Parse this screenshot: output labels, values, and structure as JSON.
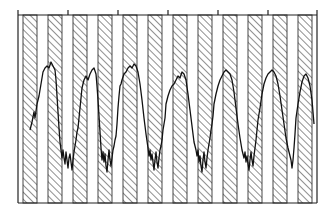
{
  "chart_data": {
    "type": "line",
    "title": "",
    "xlabel": "",
    "ylabel": "",
    "grid": false,
    "legend": null,
    "colors": {
      "line": "#111111",
      "frame": "#222222",
      "hatch": "#333333",
      "background": "#ffffff"
    },
    "frame": {
      "x0": 18,
      "y0": 15,
      "x1": 317,
      "y1": 203
    },
    "top_axis_ticks_x": [
      18,
      68,
      118,
      168,
      218,
      268,
      317
    ],
    "shaded_bands": {
      "pattern": "diagonal-hatch",
      "width": 14,
      "x_starts": [
        23,
        48,
        73,
        98,
        123,
        148,
        173,
        198,
        223,
        248,
        273,
        298
      ]
    },
    "series": [
      {
        "name": "trace",
        "cycles": 6,
        "points": [
          [
            30,
            130
          ],
          [
            32,
            122
          ],
          [
            34,
            112
          ],
          [
            35,
            118
          ],
          [
            37,
            104
          ],
          [
            39,
            96
          ],
          [
            41,
            84
          ],
          [
            43,
            72
          ],
          [
            45,
            68
          ],
          [
            47,
            66
          ],
          [
            49,
            68
          ],
          [
            51,
            62
          ],
          [
            53,
            66
          ],
          [
            55,
            70
          ],
          [
            56,
            80
          ],
          [
            57,
            96
          ],
          [
            58,
            112
          ],
          [
            59,
            128
          ],
          [
            60,
            142
          ],
          [
            61,
            150
          ],
          [
            62,
            158
          ],
          [
            63,
            150
          ],
          [
            64,
            158
          ],
          [
            65,
            164
          ],
          [
            66,
            152
          ],
          [
            67,
            160
          ],
          [
            68,
            168
          ],
          [
            69,
            158
          ],
          [
            70,
            154
          ],
          [
            71,
            162
          ],
          [
            72,
            170
          ],
          [
            73,
            160
          ],
          [
            74,
            152
          ],
          [
            75,
            146
          ],
          [
            76,
            140
          ],
          [
            77,
            132
          ],
          [
            78,
            128
          ],
          [
            79,
            118
          ],
          [
            80,
            108
          ],
          [
            81,
            98
          ],
          [
            82,
            88
          ],
          [
            84,
            80
          ],
          [
            86,
            76
          ],
          [
            88,
            80
          ],
          [
            90,
            74
          ],
          [
            92,
            70
          ],
          [
            94,
            68
          ],
          [
            96,
            74
          ],
          [
            97,
            86
          ],
          [
            98,
            100
          ],
          [
            99,
            116
          ],
          [
            100,
            132
          ],
          [
            101,
            148
          ],
          [
            102,
            160
          ],
          [
            103,
            152
          ],
          [
            104,
            162
          ],
          [
            105,
            154
          ],
          [
            106,
            166
          ],
          [
            107,
            172
          ],
          [
            108,
            160
          ],
          [
            109,
            150
          ],
          [
            110,
            160
          ],
          [
            111,
            166
          ],
          [
            112,
            158
          ],
          [
            113,
            150
          ],
          [
            114,
            146
          ],
          [
            115,
            140
          ],
          [
            116,
            136
          ],
          [
            117,
            124
          ],
          [
            118,
            108
          ],
          [
            119,
            96
          ],
          [
            120,
            86
          ],
          [
            121,
            84
          ],
          [
            122,
            80
          ],
          [
            124,
            74
          ],
          [
            126,
            72
          ],
          [
            128,
            68
          ],
          [
            130,
            66
          ],
          [
            132,
            68
          ],
          [
            134,
            64
          ],
          [
            136,
            66
          ],
          [
            138,
            72
          ],
          [
            140,
            84
          ],
          [
            142,
            100
          ],
          [
            144,
            118
          ],
          [
            146,
            134
          ],
          [
            148,
            148
          ],
          [
            149,
            156
          ],
          [
            150,
            150
          ],
          [
            151,
            160
          ],
          [
            152,
            154
          ],
          [
            153,
            162
          ],
          [
            154,
            170
          ],
          [
            155,
            160
          ],
          [
            156,
            152
          ],
          [
            157,
            162
          ],
          [
            158,
            168
          ],
          [
            159,
            158
          ],
          [
            160,
            150
          ],
          [
            161,
            146
          ],
          [
            162,
            140
          ],
          [
            163,
            130
          ],
          [
            164,
            124
          ],
          [
            165,
            118
          ],
          [
            166,
            104
          ],
          [
            168,
            96
          ],
          [
            170,
            90
          ],
          [
            172,
            86
          ],
          [
            174,
            84
          ],
          [
            176,
            80
          ],
          [
            178,
            76
          ],
          [
            180,
            78
          ],
          [
            182,
            72
          ],
          [
            184,
            74
          ],
          [
            186,
            80
          ],
          [
            188,
            94
          ],
          [
            190,
            110
          ],
          [
            192,
            126
          ],
          [
            194,
            142
          ],
          [
            196,
            150
          ],
          [
            197,
            156
          ],
          [
            198,
            150
          ],
          [
            199,
            162
          ],
          [
            200,
            156
          ],
          [
            201,
            166
          ],
          [
            202,
            172
          ],
          [
            203,
            160
          ],
          [
            204,
            152
          ],
          [
            205,
            162
          ],
          [
            206,
            168
          ],
          [
            207,
            158
          ],
          [
            208,
            150
          ],
          [
            209,
            144
          ],
          [
            210,
            138
          ],
          [
            211,
            130
          ],
          [
            212,
            124
          ],
          [
            213,
            116
          ],
          [
            214,
            104
          ],
          [
            216,
            94
          ],
          [
            218,
            86
          ],
          [
            220,
            80
          ],
          [
            222,
            76
          ],
          [
            224,
            72
          ],
          [
            226,
            70
          ],
          [
            228,
            72
          ],
          [
            230,
            74
          ],
          [
            232,
            80
          ],
          [
            234,
            92
          ],
          [
            236,
            108
          ],
          [
            238,
            124
          ],
          [
            240,
            138
          ],
          [
            242,
            150
          ],
          [
            244,
            158
          ],
          [
            245,
            152
          ],
          [
            246,
            162
          ],
          [
            247,
            156
          ],
          [
            248,
            164
          ],
          [
            249,
            170
          ],
          [
            250,
            160
          ],
          [
            251,
            152
          ],
          [
            252,
            160
          ],
          [
            253,
            166
          ],
          [
            254,
            156
          ],
          [
            255,
            148
          ],
          [
            256,
            140
          ],
          [
            257,
            130
          ],
          [
            258,
            120
          ],
          [
            260,
            108
          ],
          [
            262,
            94
          ],
          [
            264,
            84
          ],
          [
            266,
            78
          ],
          [
            268,
            74
          ],
          [
            270,
            72
          ],
          [
            272,
            70
          ],
          [
            274,
            72
          ],
          [
            276,
            76
          ],
          [
            278,
            84
          ],
          [
            280,
            96
          ],
          [
            282,
            110
          ],
          [
            284,
            124
          ],
          [
            286,
            138
          ],
          [
            288,
            148
          ],
          [
            290,
            156
          ],
          [
            291,
            160
          ],
          [
            292,
            168
          ],
          [
            293,
            160
          ],
          [
            294,
            148
          ],
          [
            295,
            134
          ],
          [
            296,
            118
          ],
          [
            298,
            104
          ],
          [
            300,
            92
          ],
          [
            302,
            82
          ],
          [
            304,
            76
          ],
          [
            306,
            74
          ],
          [
            308,
            78
          ],
          [
            310,
            86
          ],
          [
            312,
            100
          ],
          [
            313,
            112
          ],
          [
            314,
            124
          ]
        ]
      }
    ]
  }
}
